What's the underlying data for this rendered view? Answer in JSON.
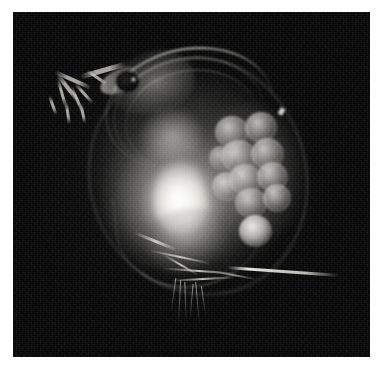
{
  "figure": {
    "technique": "darkfield photomicrograph",
    "background_color": "#050505",
    "border_color": "#ffffff",
    "highlight_color": "#f4f2ec",
    "eye_color": "#060606",
    "plate": {
      "left": 13,
      "top": 12,
      "width": 357,
      "height": 345
    }
  },
  "anatomy": {
    "carapace": "carapace",
    "dorsal_ridges": "dorsal carapace ridges",
    "head": "head",
    "rostrum": "rostrum",
    "compound_eye": "compound eye",
    "eye_glint": "eye specular highlight",
    "antennae": "branched swimming antennae",
    "gut_core": "illuminated thoracic core",
    "brood_chamber": "brood chamber",
    "eggs": "developing eggs",
    "egg_lower": "isolated lower egg",
    "thoracic_legs": "thoracic filtering appendages",
    "post_abdomen_setae": "post-abdominal setae",
    "bristles": "fine ventral bristles",
    "tail_spine": "apical tail spine",
    "ventral_margin": "ventral carapace margin"
  },
  "counts": {
    "eggs_in_cluster": 10,
    "isolated_eggs": 1,
    "antenna_branches": 9,
    "dorsal_ridges": 3,
    "setae": 5,
    "bristles": 6
  }
}
